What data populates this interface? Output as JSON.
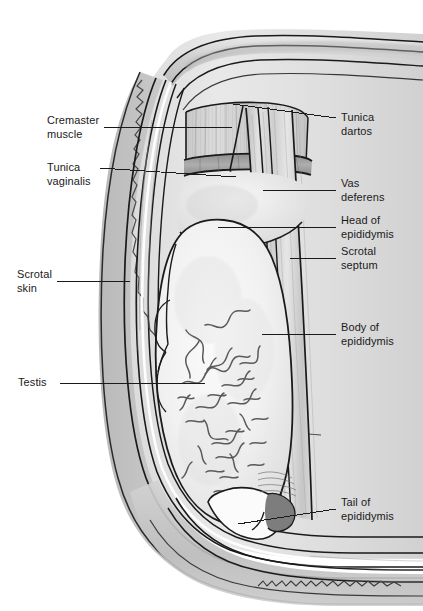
{
  "figure": {
    "width": 423,
    "height": 611,
    "background_color": "#ffffff",
    "line_color": "#1a1a1a",
    "style": "grayscale medical line illustration with stippled shading"
  },
  "labels": {
    "cremaster_muscle": "Cremaster\nmuscle",
    "tunica_vaginalis": "Tunica\nvaginalis",
    "scrotal_skin": "Scrotal\nskin",
    "testis": "Testis",
    "tunica_dartos": "Tunica\ndartos",
    "vas_deferens": "Vas\ndeferens",
    "head_of_epididymis": "Head of\nepididymis",
    "scrotal_septum": "Scrotal\nseptum",
    "body_of_epididymis": "Body of\nepididymis",
    "tail_of_epididymis": "Tail of\nepididymis"
  },
  "leader_lines": [
    {
      "name": "cremaster-muscle",
      "side": "left",
      "from": [
        104,
        127
      ],
      "to": [
        232,
        127
      ]
    },
    {
      "name": "tunica-vaginalis",
      "side": "left",
      "from": [
        100,
        168
      ],
      "to": [
        236,
        177
      ]
    },
    {
      "name": "scrotal-skin",
      "side": "left",
      "from": [
        57,
        281
      ],
      "to": [
        130,
        281
      ]
    },
    {
      "name": "testis",
      "side": "left",
      "from": [
        60,
        383
      ],
      "to": [
        205,
        383
      ]
    },
    {
      "name": "tunica-dartos",
      "side": "right",
      "from": [
        336,
        118
      ],
      "to": [
        233,
        104
      ]
    },
    {
      "name": "vas-deferens",
      "side": "right",
      "from": [
        336,
        190
      ],
      "to": [
        263,
        190
      ]
    },
    {
      "name": "head-of-epididymis",
      "side": "right",
      "from": [
        336,
        227
      ],
      "to": [
        218,
        227
      ]
    },
    {
      "name": "scrotal-septum",
      "side": "right",
      "from": [
        336,
        258
      ],
      "to": [
        290,
        258
      ]
    },
    {
      "name": "body-of-epididymis",
      "side": "right",
      "from": [
        336,
        334
      ],
      "to": [
        262,
        334
      ]
    },
    {
      "name": "tail-of-epididymis",
      "side": "right",
      "from": [
        336,
        509
      ],
      "to": [
        238,
        524
      ]
    }
  ],
  "colors": {
    "ink": "#1a1a1a",
    "tissue_light": "#f0f0f0",
    "tissue_mid": "#c9c9c9",
    "tissue_dark": "#9a9a9a",
    "shadow": "#6f6f6f",
    "paper": "#ffffff"
  }
}
